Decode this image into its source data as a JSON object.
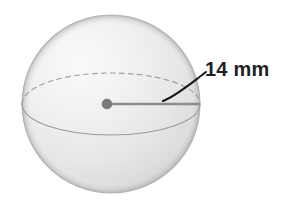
{
  "figure": {
    "shape": "sphere",
    "background_color": "#ffffff"
  },
  "annotations": {
    "radius_label": "14 mm",
    "radius_value": 14,
    "radius_unit": "mm",
    "label_color": "#231f20"
  },
  "geometry": {
    "sphere_center_x": 111,
    "sphere_center_y": 104,
    "sphere_radius": 89,
    "center_dot_x": 107,
    "center_dot_y": 104,
    "center_dot_radius": 5,
    "radius_line_start_x": 107,
    "radius_line_start_y": 104,
    "radius_line_end_x": 200,
    "radius_line_end_y": 104,
    "equator_rx": 89,
    "equator_ry": 31
  },
  "colors": {
    "sphere_fill_light": "#f4f4f4",
    "sphere_fill_mid": "#e6e6e6",
    "sphere_fill_dark": "#d2d2d2",
    "sphere_outline": "#b4b4b4",
    "equator_line": "#9a9a9a",
    "radius_line": "#8c8c8c",
    "center_dot": "#7a7a7a",
    "leader_line": "#1a1a1a"
  }
}
